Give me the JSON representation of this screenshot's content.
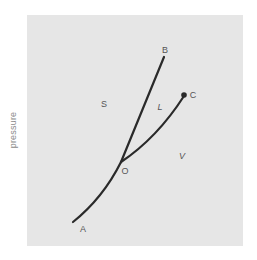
{
  "diagram": {
    "type": "phase-diagram",
    "y_axis_label": "pressure",
    "colors": {
      "panel_background": "#e6e6e6",
      "curve": "#2a2a2a",
      "label": "#555555",
      "axis_label": "#8a8a8a"
    },
    "points": {
      "A": "A",
      "B": "B",
      "C": "C",
      "O": "O"
    },
    "regions": {
      "solid": "S",
      "liquid": "L",
      "vapor": "V"
    },
    "curves": [
      {
        "name": "sublimation",
        "from": "A",
        "to": "O"
      },
      {
        "name": "fusion",
        "from": "O",
        "to": "B"
      },
      {
        "name": "vaporization",
        "from": "O",
        "to": "C"
      }
    ]
  }
}
